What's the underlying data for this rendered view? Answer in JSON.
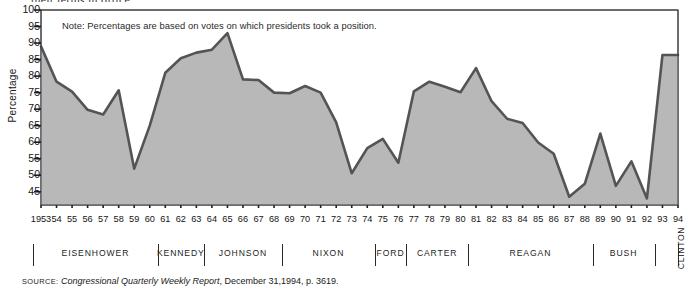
{
  "clipped_top_text": "their terms in office.",
  "note": "Note: Percentages are based on votes on which presidents took a position.",
  "source": {
    "label": "SOURCE:",
    "italic_title": "Congressional Quarterly Weekly Report",
    "rest": ", December 31,1994, p. 3619."
  },
  "axis": {
    "ylabel": "Percentage",
    "yticks": [
      45,
      50,
      55,
      60,
      65,
      70,
      75,
      80,
      85,
      90,
      95,
      100
    ]
  },
  "presidents": [
    {
      "name": "EISENHOWER",
      "start": 1953,
      "end": 1960
    },
    {
      "name": "KENNEDY",
      "start": 1961,
      "end": 1963
    },
    {
      "name": "JOHNSON",
      "start": 1964,
      "end": 1968
    },
    {
      "name": "NIXON",
      "start": 1969,
      "end": 1974
    },
    {
      "name": "FORD",
      "start": 1975,
      "end": 1976
    },
    {
      "name": "CARTER",
      "start": 1977,
      "end": 1980
    },
    {
      "name": "REAGAN",
      "start": 1981,
      "end": 1988
    },
    {
      "name": "BUSH",
      "start": 1989,
      "end": 1992
    },
    {
      "name": "CLINTON",
      "start": 1993,
      "end": 1994,
      "vertical": true
    }
  ],
  "chart_data": {
    "type": "area",
    "title": "",
    "xlabel": "",
    "ylabel": "Percentage",
    "ylim": [
      41,
      100
    ],
    "xlim": [
      1953,
      1994
    ],
    "grid": false,
    "legend": "none",
    "annotation": "Note: Percentages are based on votes on which presidents took a position.",
    "line_color": "#545454",
    "fill_color": "#b8b8b8",
    "x": [
      1953,
      1954,
      1955,
      1956,
      1957,
      1958,
      1959,
      1960,
      1961,
      1962,
      1963,
      1964,
      1965,
      1966,
      1967,
      1968,
      1969,
      1970,
      1971,
      1972,
      1973,
      1974,
      1975,
      1976,
      1977,
      1978,
      1979,
      1980,
      1981,
      1982,
      1983,
      1984,
      1985,
      1986,
      1987,
      1988,
      1989,
      1990,
      1991,
      1992,
      1993,
      1994
    ],
    "tick_labels": [
      "1953",
      "54",
      "55",
      "56",
      "57",
      "58",
      "59",
      "60",
      "61",
      "62",
      "63",
      "64",
      "65",
      "66",
      "67",
      "68",
      "69",
      "70",
      "71",
      "72",
      "73",
      "74",
      "75",
      "76",
      "77",
      "78",
      "79",
      "80",
      "81",
      "82",
      "83",
      "84",
      "85",
      "86",
      "87",
      "88",
      "89",
      "90",
      "91",
      "92",
      "93",
      "94"
    ],
    "values": [
      89.0,
      78.3,
      75.3,
      69.8,
      68.4,
      75.7,
      52.0,
      65.0,
      81.0,
      85.4,
      87.1,
      88.0,
      93.0,
      79.0,
      78.8,
      75.0,
      74.8,
      77.0,
      75.0,
      66.0,
      50.6,
      58.2,
      61.0,
      53.8,
      75.4,
      78.3,
      76.8,
      75.1,
      82.4,
      72.4,
      67.1,
      65.8,
      59.9,
      56.5,
      43.5,
      47.4,
      62.6,
      46.8,
      54.2,
      43.0,
      86.4,
      86.4
    ]
  }
}
